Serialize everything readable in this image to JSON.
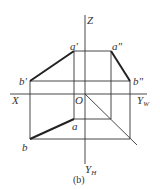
{
  "diagram": {
    "caption": "(b)",
    "axes": {
      "z_label": "Z",
      "x_label": "X",
      "yw_label": "Y",
      "yw_sub": "W",
      "yh_label": "Y",
      "yh_sub": "H",
      "origin_label": "O"
    },
    "points": {
      "a_prime": "a'",
      "a_double_prime": "a\"",
      "b_prime": "b'",
      "b_double_prime": "b\"",
      "a": "a",
      "b": "b"
    },
    "colors": {
      "line": "#333333",
      "bold_line": "#222222"
    }
  }
}
